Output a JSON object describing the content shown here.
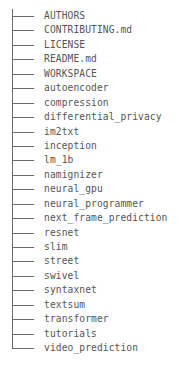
{
  "tree": {
    "entries": [
      {
        "name": "AUTHORS"
      },
      {
        "name": "CONTRIBUTING.md"
      },
      {
        "name": "LICENSE"
      },
      {
        "name": "README.md"
      },
      {
        "name": "WORKSPACE"
      },
      {
        "name": "autoencoder"
      },
      {
        "name": "compression"
      },
      {
        "name": "differential_privacy"
      },
      {
        "name": "im2txt"
      },
      {
        "name": "inception"
      },
      {
        "name": "lm_1b"
      },
      {
        "name": "namignizer"
      },
      {
        "name": "neural_gpu"
      },
      {
        "name": "neural_programmer"
      },
      {
        "name": "next_frame_prediction"
      },
      {
        "name": "resnet"
      },
      {
        "name": "slim"
      },
      {
        "name": "street"
      },
      {
        "name": "swivel"
      },
      {
        "name": "syntaxnet"
      },
      {
        "name": "textsum"
      },
      {
        "name": "transformer"
      },
      {
        "name": "tutorials"
      },
      {
        "name": "video_prediction"
      }
    ]
  }
}
